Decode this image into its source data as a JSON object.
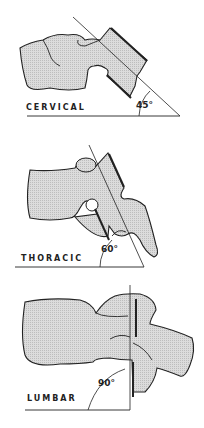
{
  "panels": [
    {
      "label": "CERVICAL",
      "angle": "45°"
    },
    {
      "label": "THORACIC",
      "angle": "60°"
    },
    {
      "label": "LUMBAR",
      "angle": "90°"
    }
  ],
  "colors": {
    "bone_fill": "#d4d4d4",
    "line": "#222222",
    "background": "#ffffff"
  }
}
